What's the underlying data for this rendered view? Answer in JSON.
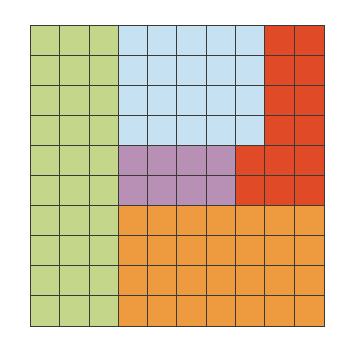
{
  "grid": {
    "rows": 10,
    "cols": 10,
    "line_color": "#3a3a36"
  },
  "colors": {
    "G": "#c3d68a",
    "B": "#c6e1f2",
    "R": "#e04a26",
    "P": "#b890b5",
    "O": "#ee9a3e"
  },
  "regions": [
    {
      "key": "G",
      "name": "green",
      "cells": 30
    },
    {
      "key": "B",
      "name": "light-blue",
      "cells": 20
    },
    {
      "key": "R",
      "name": "red",
      "cells": 14
    },
    {
      "key": "P",
      "name": "purple",
      "cells": 8
    },
    {
      "key": "O",
      "name": "orange",
      "cells": 28
    }
  ],
  "layout": [
    "GGGBBBBBRR",
    "GGGBBBBBRR",
    "GGGBBBBBRR",
    "GGGBBBBBRR",
    "GGGPPPPRRR",
    "GGGPPPPRRR",
    "GGGOOOOOOO",
    "GGGOOOOOOO",
    "GGGOOOOOOO",
    "GGGOOOOOOO"
  ]
}
